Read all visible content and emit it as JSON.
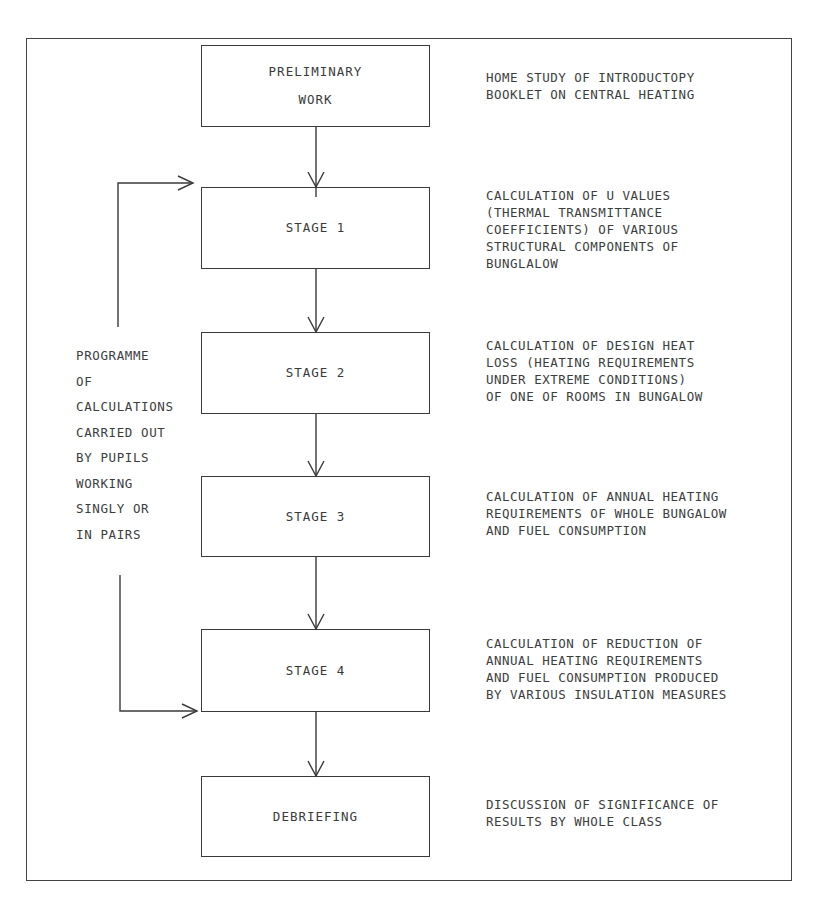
{
  "diagram": {
    "type": "flowchart",
    "nodes": [
      {
        "id": "preliminary",
        "label": "PRELIMINARY\nWORK",
        "description": "HOME STUDY OF INTRODUCTOPY\nBOOKLET ON CENTRAL HEATING"
      },
      {
        "id": "stage1",
        "label": "STAGE 1",
        "description": "CALCULATION OF U VALUES\n(THERMAL TRANSMITTANCE\nCOEFFICIENTS) OF VARIOUS\nSTRUCTURAL COMPONENTS OF\nBUNGLALOW"
      },
      {
        "id": "stage2",
        "label": "STAGE 2",
        "description": "CALCULATION OF DESIGN HEAT\nLOSS (HEATING REQUIREMENTS\nUNDER EXTREME CONDITIONS)\nOF ONE OF ROOMS IN BUNGALOW"
      },
      {
        "id": "stage3",
        "label": "STAGE 3",
        "description": "CALCULATION OF ANNUAL HEATING\nREQUIREMENTS OF WHOLE BUNGALOW\nAND FUEL CONSUMPTION"
      },
      {
        "id": "stage4",
        "label": "STAGE 4",
        "description": "CALCULATION OF REDUCTION OF\nANNUAL HEATING REQUIREMENTS\nAND FUEL CONSUMPTION PRODUCED\nBY VARIOUS INSULATION MEASURES"
      },
      {
        "id": "debriefing",
        "label": "DEBRIEFING",
        "description": "DISCUSSION OF SIGNIFICANCE OF\nRESULTS BY WHOLE CLASS"
      }
    ],
    "edges": [
      {
        "from": "preliminary",
        "to": "stage1"
      },
      {
        "from": "stage1",
        "to": "stage2"
      },
      {
        "from": "stage2",
        "to": "stage3"
      },
      {
        "from": "stage3",
        "to": "stage4"
      },
      {
        "from": "stage4",
        "to": "debriefing"
      }
    ],
    "bracket": {
      "spans": [
        "stage1",
        "stage4"
      ],
      "label": "PROGRAMME\nOF\nCALCULATIONS\nCARRIED OUT\nBY PUPILS\nWORKING\nSINGLY OR\nIN PAIRS"
    },
    "colors": {
      "line": "#3a3a3a",
      "background": "#ffffff",
      "text": "#3d3d3d"
    }
  }
}
